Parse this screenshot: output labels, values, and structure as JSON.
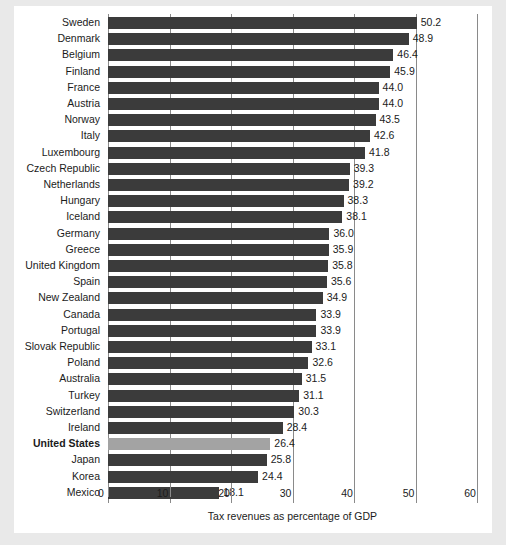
{
  "chart_data": {
    "type": "bar",
    "orientation": "horizontal",
    "title": "",
    "xlabel": "Tax revenues as percentage of GDP",
    "ylabel": "",
    "xlim": [
      0,
      60
    ],
    "xticks": [
      0,
      10,
      20,
      30,
      40,
      50,
      60
    ],
    "grid": true,
    "legend": null,
    "highlight_category": "United States",
    "colors": {
      "bar": "#3b3b3b",
      "highlight_bar": "#a3a3a3",
      "grid": "#8a8a8a",
      "text": "#1b1b1b",
      "background": "#ffffff",
      "page_surround": "#e9e9e9"
    },
    "categories": [
      "Sweden",
      "Denmark",
      "Belgium",
      "Finland",
      "France",
      "Austria",
      "Norway",
      "Italy",
      "Luxembourg",
      "Czech Republic",
      "Netherlands",
      "Hungary",
      "Iceland",
      "Germany",
      "Greece",
      "United Kingdom",
      "Spain",
      "New Zealand",
      "Canada",
      "Portugal",
      "Slovak Republic",
      "Poland",
      "Australia",
      "Turkey",
      "Switzerland",
      "Ireland",
      "United States",
      "Japan",
      "Korea",
      "Mexico"
    ],
    "values": [
      50.2,
      48.9,
      46.4,
      45.9,
      44.0,
      44.0,
      43.5,
      42.6,
      41.8,
      39.3,
      39.2,
      38.3,
      38.1,
      36.0,
      35.9,
      35.8,
      35.6,
      34.9,
      33.9,
      33.9,
      33.1,
      32.6,
      31.5,
      31.1,
      30.3,
      28.4,
      26.4,
      25.8,
      24.4,
      18.1
    ],
    "value_labels": [
      "50.2",
      "48.9",
      "46.4",
      "45.9",
      "44.0",
      "44.0",
      "43.5",
      "42.6",
      "41.8",
      "39.3",
      "39.2",
      "38.3",
      "38.1",
      "36.0",
      "35.9",
      "35.8",
      "35.6",
      "34.9",
      "33.9",
      "33.9",
      "33.1",
      "32.6",
      "31.5",
      "31.1",
      "30.3",
      "28.4",
      "26.4",
      "25.8",
      "24.4",
      "18.1"
    ],
    "xtick_labels": [
      "0",
      "10",
      "20",
      "30",
      "40",
      "50",
      "60"
    ]
  }
}
